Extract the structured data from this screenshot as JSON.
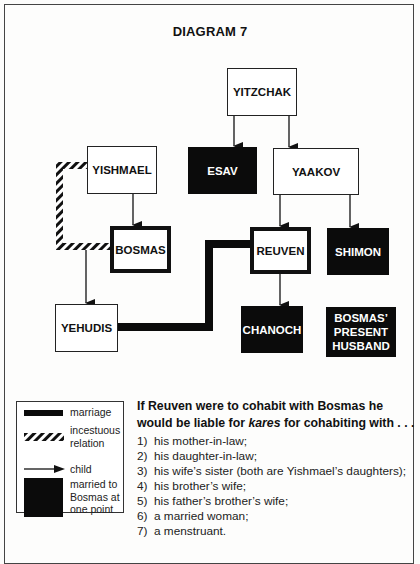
{
  "title": "DIAGRAM 7",
  "people": {
    "yitzchak": "YITZCHAK",
    "esav": "ESAV",
    "yaakov": "YAAKOV",
    "yishmael": "YISHMAEL",
    "bosmas": "BOSMAS",
    "reuven": "REUVEN",
    "shimon": "SHIMON",
    "yehudis": "YEHUDIS",
    "chanoch": "CHANOCH",
    "bosmas_husband_line1": "BOSMAS’",
    "bosmas_husband_line2": "PRESENT",
    "bosmas_husband_line3": "HUSBAND"
  },
  "relations": [
    {
      "type": "child",
      "from": "YITZCHAK",
      "to": "ESAV"
    },
    {
      "type": "child",
      "from": "YITZCHAK",
      "to": "YAAKOV"
    },
    {
      "type": "child",
      "from": "YISHMAEL",
      "to": "BOSMAS"
    },
    {
      "type": "child",
      "from": "YISHMAEL",
      "to": "YEHUDIS"
    },
    {
      "type": "child",
      "from": "YAAKOV",
      "to": "REUVEN"
    },
    {
      "type": "child",
      "from": "YAAKOV",
      "to": "SHIMON"
    },
    {
      "type": "child",
      "from": "REUVEN",
      "to": "CHANOCH"
    },
    {
      "type": "marriage",
      "from": "YEHUDIS",
      "to": "REUVEN"
    },
    {
      "type": "incestuous",
      "from": "YISHMAEL",
      "to": "BOSMAS"
    }
  ],
  "legend": {
    "marriage": "marriage",
    "incestuous_line1": "incestuous",
    "incestuous_line2": "relation",
    "child": "child",
    "married_line1": "married to",
    "married_line2": "Bosmas at",
    "married_line3": "one point"
  },
  "text": {
    "intro_before": "If Reuven were to cohabit with Bosmas he would be liable for ",
    "intro_em": "kares",
    "intro_after": " for cohabiting with . . .",
    "items": [
      {
        "num": "1)",
        "text": "his mother-in-law;"
      },
      {
        "num": "2)",
        "text": "his daughter-in-law;"
      },
      {
        "num": "3)",
        "text": "his wife’s sister (both are Yishmael’s daughters);"
      },
      {
        "num": "4)",
        "text": "his brother’s wife;"
      },
      {
        "num": "5)",
        "text": "his father’s brother’s wife;"
      },
      {
        "num": "6)",
        "text": "a married woman;"
      },
      {
        "num": "7)",
        "text": "a menstruant."
      }
    ]
  }
}
